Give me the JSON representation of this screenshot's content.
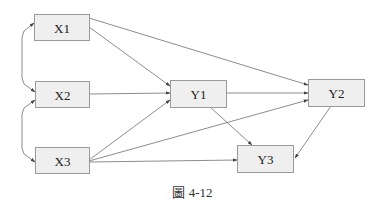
{
  "diagram": {
    "type": "path-diagram",
    "nodes": [
      {
        "id": "X1",
        "label": "X1"
      },
      {
        "id": "X2",
        "label": "X2"
      },
      {
        "id": "X3",
        "label": "X3"
      },
      {
        "id": "Y1",
        "label": "Y1"
      },
      {
        "id": "Y2",
        "label": "Y2"
      },
      {
        "id": "Y3",
        "label": "Y3"
      }
    ],
    "edges": [
      {
        "from": "X1",
        "to": "Y1",
        "kind": "directed"
      },
      {
        "from": "X1",
        "to": "Y2",
        "kind": "directed"
      },
      {
        "from": "X2",
        "to": "Y1",
        "kind": "directed"
      },
      {
        "from": "X3",
        "to": "Y1",
        "kind": "directed"
      },
      {
        "from": "X3",
        "to": "Y2",
        "kind": "directed"
      },
      {
        "from": "X3",
        "to": "Y3",
        "kind": "directed"
      },
      {
        "from": "Y1",
        "to": "Y2",
        "kind": "directed"
      },
      {
        "from": "Y1",
        "to": "Y3",
        "kind": "directed"
      },
      {
        "from": "Y2",
        "to": "Y3",
        "kind": "directed"
      },
      {
        "from": "X1",
        "to": "X2",
        "kind": "correlation"
      },
      {
        "from": "X2",
        "to": "X3",
        "kind": "correlation"
      }
    ],
    "colors": {
      "node_fill": "#efefef",
      "node_border": "#9a9a9a",
      "edge": "#6e6e6e",
      "text": "#222222"
    }
  },
  "caption": "圖 4-12"
}
